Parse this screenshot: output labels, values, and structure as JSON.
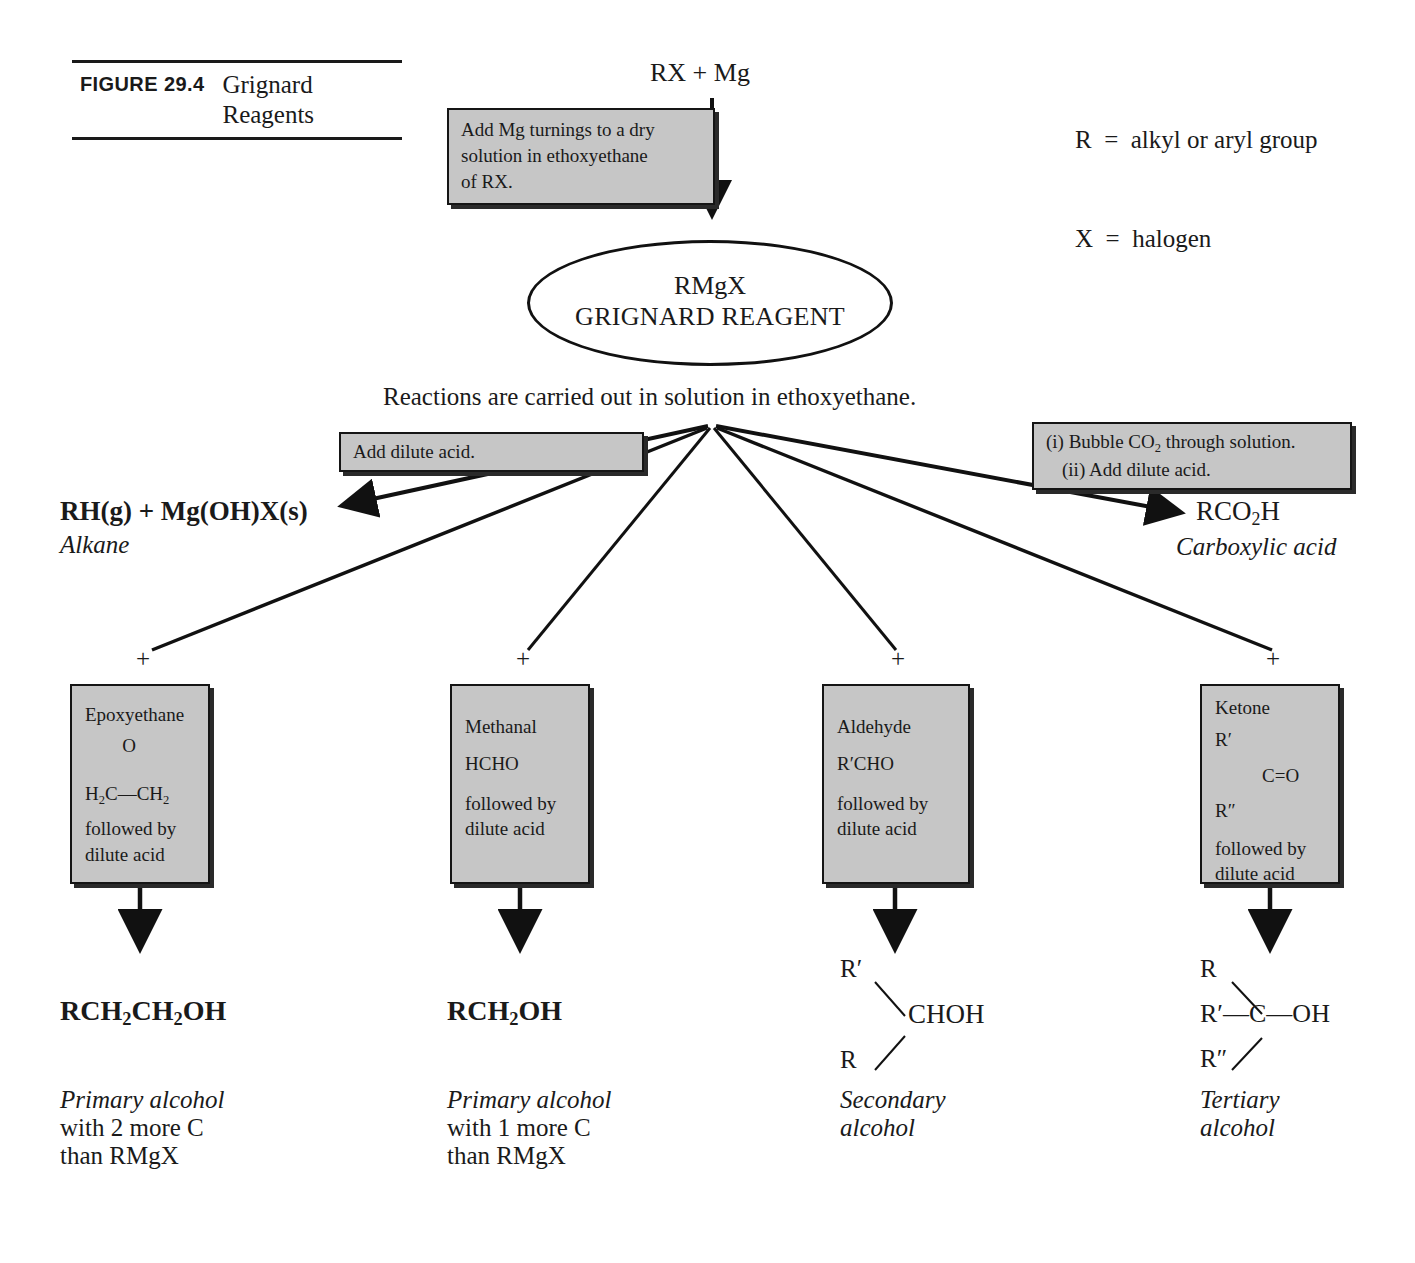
{
  "figure": {
    "tag": "FIGURE 29.4",
    "title_line1": "Grignard",
    "title_line2": "Reagents"
  },
  "legend": {
    "line1": "R  =  alkyl or aryl group",
    "line2": "X  =  halogen"
  },
  "flow": {
    "start_reagents": "RX + Mg",
    "step1_box": {
      "line1": "Add Mg turnings to a dry",
      "line2": "solution in ethoxyethane",
      "line3": "of RX."
    },
    "product_node": {
      "formula": "RMgX",
      "name": "GRIGNARD REAGENT"
    },
    "solvent_note": "Reactions are carried out in solution in ethoxyethane."
  },
  "left_branch": {
    "box_label": "Add dilute acid.",
    "product_html": "RH(g) + Mg(OH)X(s)",
    "product_class": "Alkane"
  },
  "right_branch": {
    "box_line1": "(i) Bubble CO2 through solution.",
    "box_line2": "(ii) Add dilute acid.",
    "product": "RCO2H",
    "product_class": "Carboxylic acid"
  },
  "plus_sign": "+",
  "branches": [
    {
      "reagent_name": "Epoxyethane",
      "reagent_formula_top": "O",
      "reagent_formula_bottom": "H2C—CH2",
      "condition_line1": "followed by",
      "condition_line2": "dilute acid",
      "product": "RCH2CH2OH",
      "caption_line1": "Primary alcohol",
      "caption_line2": "with 2 more C",
      "caption_line3": "than RMgX"
    },
    {
      "reagent_name": "Methanal",
      "reagent_formula": "HCHO",
      "condition_line1": "followed by",
      "condition_line2": "dilute acid",
      "product": "RCH2OH",
      "caption_line1": "Primary alcohol",
      "caption_line2": "with 1 more C",
      "caption_line3": "than RMgX"
    },
    {
      "reagent_name": "Aldehyde",
      "reagent_formula": "R′CHO",
      "condition_line1": "followed by",
      "condition_line2": "dilute acid",
      "product_top": "R′",
      "product_mid": "CHOH",
      "product_bottom": "R",
      "caption_line1": "Secondary",
      "caption_line2": "alcohol"
    },
    {
      "reagent_name": "Ketone",
      "reagent_r1": "R′",
      "reagent_core": "C=O",
      "reagent_r2": "R″",
      "condition_line1": "followed by",
      "condition_line2": "dilute acid",
      "product_top": "R",
      "product_mid_left": "R′",
      "product_mid_right": "—C—OH",
      "product_bottom": "R″",
      "caption_line1": "Tertiary",
      "caption_line2": "alcohol"
    }
  ],
  "colors": {
    "box_fill": "#c6c6c6",
    "ink": "#1a1a1a"
  }
}
